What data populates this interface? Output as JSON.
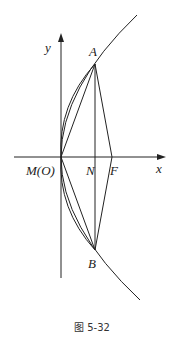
{
  "figure": {
    "caption": "图 5-32",
    "axes": {
      "x_label": "x",
      "y_label": "y"
    },
    "points": {
      "A": "A",
      "B": "B",
      "M": "M(O)",
      "N": "N",
      "F": "F"
    },
    "colors": {
      "stroke": "#222222",
      "background": "#ffffff"
    }
  }
}
